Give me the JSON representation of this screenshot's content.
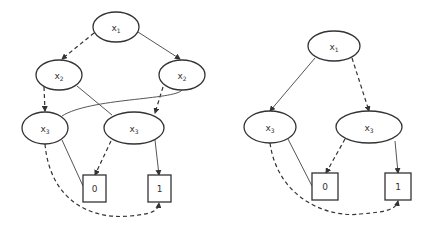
{
  "diagrams": [
    {
      "name": "unreduced-bdd",
      "nodes": {
        "x1": {
          "var": "x",
          "sub": "1"
        },
        "x2a": {
          "var": "x",
          "sub": "2"
        },
        "x2b": {
          "var": "x",
          "sub": "2"
        },
        "x3a": {
          "var": "x",
          "sub": "3"
        },
        "x3b": {
          "var": "x",
          "sub": "3"
        },
        "t0": {
          "label": "0"
        },
        "t1": {
          "label": "1"
        }
      }
    },
    {
      "name": "reduced-bdd",
      "nodes": {
        "x1": {
          "var": "x",
          "sub": "1"
        },
        "x3a": {
          "var": "x",
          "sub": "3"
        },
        "x3b": {
          "var": "x",
          "sub": "3"
        },
        "t0": {
          "label": "0"
        },
        "t1": {
          "label": "1"
        }
      }
    }
  ],
  "legend": {
    "solid_edge": "high (1) branch",
    "dashed_edge": "low (0) branch"
  }
}
